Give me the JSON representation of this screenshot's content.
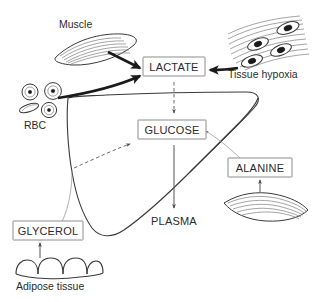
{
  "figure": {
    "type": "biological-pathway-diagram",
    "caption": "",
    "nodes": {
      "lactate": {
        "label": "LACTATE",
        "boxed": true
      },
      "glucose": {
        "label": "GLUCOSE",
        "boxed": true
      },
      "alanine": {
        "label": "ALANINE",
        "boxed": true
      },
      "glycerol": {
        "label": "GLYCEROL",
        "boxed": true
      },
      "plasma": {
        "label": "PLASMA",
        "boxed": false
      }
    },
    "tissue_labels": {
      "muscle": "Muscle",
      "tissue_hypoxia": "Tissue hypoxia",
      "rbc": "RBC",
      "adipose": "Adipose tissue"
    },
    "edges": [
      {
        "from": "Muscle",
        "to": "LACTATE",
        "style": "thick-solid"
      },
      {
        "from": "RBC",
        "to": "LACTATE",
        "style": "thick-solid"
      },
      {
        "from": "Tissue hypoxia",
        "to": "LACTATE",
        "style": "thick-solid"
      },
      {
        "from": "LACTATE",
        "to": "GLUCOSE",
        "style": "dashed"
      },
      {
        "from": "GLUCOSE",
        "to": "PLASMA",
        "style": "thin-solid"
      },
      {
        "from": "GLYCEROL",
        "to": "liver",
        "style": "hairline"
      },
      {
        "from": "ALANINE",
        "to": "liver",
        "style": "hairline"
      },
      {
        "from": "Adipose tissue",
        "to": "GLYCEROL",
        "style": "thin-solid"
      },
      {
        "from": "muscle-lower",
        "to": "ALANINE",
        "style": "thin-solid"
      },
      {
        "from": "liver-interior",
        "to": "GLUCOSE",
        "style": "dashed"
      }
    ],
    "colors": {
      "text": "#2b2b2b",
      "box_border": "#8c8c8c",
      "organ_outline": "#3a3a3a",
      "arrow_thick": "#1a1a1a",
      "arrow_thin": "#555555",
      "background": "#ffffff"
    }
  }
}
